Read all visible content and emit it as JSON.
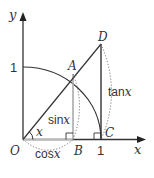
{
  "figure": {
    "type": "unit-circle-trig-diagram",
    "axes": {
      "x_label": "x",
      "y_label": "y"
    },
    "tick_labels": {
      "y_one": "1",
      "x_one": "1"
    },
    "points": {
      "origin": "O",
      "A": "A",
      "B": "B",
      "C": "C",
      "D": "D"
    },
    "angle_label": "x",
    "segment_labels": {
      "sin": "sin",
      "sin_var": "x",
      "cos": "cos",
      "cos_var": "x",
      "tan": "tan",
      "tan_var": "x"
    },
    "colors": {
      "line": "#333333",
      "projection": "#aaaaaa",
      "dotted": "#666666"
    }
  }
}
